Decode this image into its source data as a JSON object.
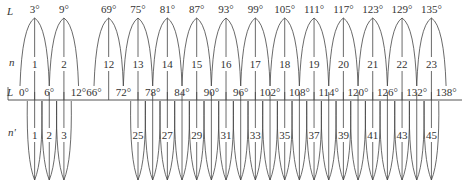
{
  "diagram": {
    "row_labels": {
      "top_L": "L",
      "n": "n",
      "mid_L": "L",
      "n_prime": "n'"
    },
    "six_degree_zones": [
      {
        "zone": "1",
        "central_meridian": "3°",
        "west": "0°",
        "east": "6°"
      },
      {
        "zone": "2",
        "central_meridian": "9°",
        "west": "6°",
        "east": "12°"
      },
      {
        "zone": "12",
        "central_meridian": "69°",
        "west": "66°",
        "east": "72°"
      },
      {
        "zone": "13",
        "central_meridian": "75°",
        "west": "72°",
        "east": "78°"
      },
      {
        "zone": "14",
        "central_meridian": "81°",
        "west": "78°",
        "east": "84°"
      },
      {
        "zone": "15",
        "central_meridian": "87°",
        "west": "84°",
        "east": "90°"
      },
      {
        "zone": "16",
        "central_meridian": "93°",
        "west": "90°",
        "east": "96°"
      },
      {
        "zone": "17",
        "central_meridian": "99°",
        "west": "96°",
        "east": "102°"
      },
      {
        "zone": "18",
        "central_meridian": "105°",
        "west": "102°",
        "east": "108°"
      },
      {
        "zone": "19",
        "central_meridian": "111°",
        "west": "108°",
        "east": "114°"
      },
      {
        "zone": "20",
        "central_meridian": "117°",
        "west": "114°",
        "east": "120°"
      },
      {
        "zone": "21",
        "central_meridian": "123°",
        "west": "120°",
        "east": "126°"
      },
      {
        "zone": "22",
        "central_meridian": "129°",
        "west": "126°",
        "east": "132°"
      },
      {
        "zone": "23",
        "central_meridian": "135°",
        "west": "132°",
        "east": "138°"
      }
    ],
    "boundary_labels": [
      "0°",
      "6°",
      "12°",
      "66°",
      "72°",
      "78°",
      "84°",
      "90°",
      "96°",
      "102°",
      "108°",
      "114°",
      "120°",
      "126°",
      "132°",
      "138°"
    ],
    "three_degree_zones_labeled": [
      "1",
      "2",
      "3",
      "25",
      "27",
      "29",
      "31",
      "33",
      "35",
      "37",
      "39",
      "41",
      "43",
      "45"
    ],
    "three_degree_zones_left": [
      1,
      2,
      3
    ],
    "three_degree_zones_right_range": [
      25,
      45
    ]
  }
}
